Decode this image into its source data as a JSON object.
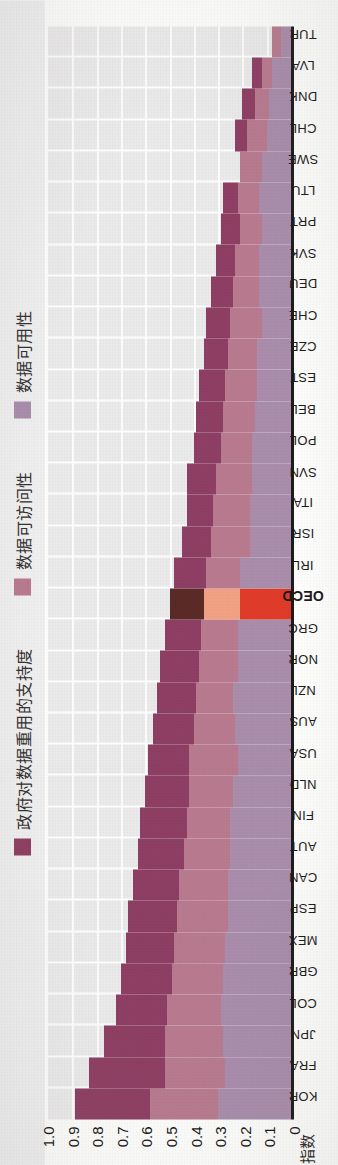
{
  "figure": {
    "yaxis_title": "指数"
  },
  "legend": {
    "items": [
      {
        "label": "政府对数据重用的支持度",
        "color": "#8e3f63",
        "key": "support"
      },
      {
        "label": "数据可访问性",
        "color": "#b87a8f",
        "key": "access"
      },
      {
        "label": "数据可用性",
        "color": "#a98dab",
        "key": "avail"
      }
    ]
  },
  "yaxis": {
    "ticks": [
      "1.0",
      "0.9",
      "0.8",
      "0.7",
      "0.6",
      "0.5",
      "0.4",
      "0.3",
      "0.2",
      "0.1",
      "0"
    ]
  },
  "chart_data": {
    "type": "bar",
    "title": "",
    "subtitle": "",
    "xlabel": "",
    "ylabel": "指数",
    "ylim": [
      0,
      1.0
    ],
    "stacked": true,
    "orientation": "vertical",
    "grid": true,
    "legend_position": "top",
    "highlight_category": "OECD",
    "highlight_colors": {
      "support": "#5a2b26",
      "access": "#f2a184",
      "avail": "#e03b2a"
    },
    "categories": [
      "KOR",
      "FRA",
      "JPN",
      "COL",
      "GBR",
      "MEX",
      "ESP",
      "CAN",
      "AUT",
      "FIN",
      "NLD",
      "USA",
      "AUS",
      "NZL",
      "NOR",
      "GRC",
      "OECD",
      "IRL",
      "ISR",
      "ITA",
      "SVN",
      "POL",
      "BEL",
      "EST",
      "CZE",
      "CHE",
      "DEU",
      "SVK",
      "PRT",
      "LTU",
      "SWE",
      "CHL",
      "DNK",
      "LVA",
      "TUR"
    ],
    "series": [
      {
        "name": "数据可用性",
        "key": "avail",
        "color": "#a98dab",
        "values": [
          0.3,
          0.27,
          0.28,
          0.29,
          0.28,
          0.27,
          0.26,
          0.26,
          0.25,
          0.25,
          0.24,
          0.22,
          0.23,
          0.24,
          0.22,
          0.22,
          0.21,
          0.21,
          0.17,
          0.17,
          0.16,
          0.16,
          0.15,
          0.14,
          0.14,
          0.12,
          0.13,
          0.13,
          0.12,
          0.13,
          0.12,
          0.1,
          0.09,
          0.08,
          0.04
        ]
      },
      {
        "name": "数据可访问性",
        "key": "access",
        "color": "#b87a8f",
        "values": [
          0.28,
          0.25,
          0.24,
          0.22,
          0.21,
          0.21,
          0.21,
          0.2,
          0.19,
          0.18,
          0.18,
          0.2,
          0.17,
          0.15,
          0.16,
          0.15,
          0.15,
          0.14,
          0.16,
          0.15,
          0.15,
          0.13,
          0.13,
          0.13,
          0.12,
          0.13,
          0.11,
          0.1,
          0.09,
          0.09,
          0.09,
          0.08,
          0.06,
          0.04,
          0.04
        ]
      },
      {
        "name": "政府对数据重用的支持度",
        "key": "support",
        "color": "#8e3f63",
        "values": [
          0.31,
          0.31,
          0.25,
          0.21,
          0.21,
          0.2,
          0.2,
          0.19,
          0.19,
          0.19,
          0.18,
          0.17,
          0.17,
          0.16,
          0.16,
          0.15,
          0.14,
          0.13,
          0.12,
          0.11,
          0.12,
          0.11,
          0.11,
          0.11,
          0.1,
          0.1,
          0.09,
          0.08,
          0.08,
          0.06,
          0.0,
          0.05,
          0.05,
          0.04,
          0.0
        ]
      }
    ]
  }
}
